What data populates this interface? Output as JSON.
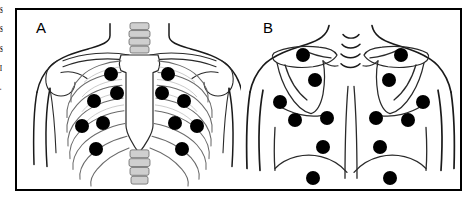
{
  "figure": {
    "caption_fragment_left": [
      "S",
      "S",
      "S",
      "I",
      "."
    ],
    "frame_color": "#000000",
    "background_color": "#ffffff",
    "marker_color": "#000000",
    "line_color": "#1a1a1a"
  },
  "panels": [
    {
      "id": "A",
      "label": "A",
      "view": "anterior-chest",
      "anatomy": [
        "neck",
        "shoulders",
        "clavicle-left",
        "clavicle-right",
        "sternum",
        "ribcage",
        "thoracic-spine",
        "scapula-left",
        "scapula-right"
      ],
      "marker_count": 12,
      "markers": [
        {
          "id": "A-R1",
          "side": "right",
          "cx": 94,
          "cy": 64,
          "r": 7.0
        },
        {
          "id": "A-R2",
          "side": "right",
          "cx": 100,
          "cy": 83,
          "r": 7.0
        },
        {
          "id": "A-R3",
          "side": "right",
          "cx": 77,
          "cy": 91,
          "r": 7.0
        },
        {
          "id": "A-R4",
          "side": "right",
          "cx": 86,
          "cy": 113,
          "r": 7.0
        },
        {
          "id": "A-R5",
          "side": "right",
          "cx": 65,
          "cy": 116,
          "r": 7.0
        },
        {
          "id": "A-R6",
          "side": "right",
          "cx": 79,
          "cy": 139,
          "r": 7.0
        },
        {
          "id": "A-L1",
          "side": "left",
          "cx": 151,
          "cy": 64,
          "r": 7.0
        },
        {
          "id": "A-L2",
          "side": "left",
          "cx": 145,
          "cy": 83,
          "r": 7.0
        },
        {
          "id": "A-L3",
          "side": "left",
          "cx": 167,
          "cy": 91,
          "r": 7.0
        },
        {
          "id": "A-L4",
          "side": "left",
          "cx": 158,
          "cy": 113,
          "r": 7.0
        },
        {
          "id": "A-L5",
          "side": "left",
          "cx": 180,
          "cy": 116,
          "r": 7.0
        },
        {
          "id": "A-L6",
          "side": "left",
          "cx": 165,
          "cy": 139,
          "r": 7.0
        }
      ]
    },
    {
      "id": "B",
      "label": "B",
      "view": "posterior-back",
      "anatomy": [
        "neck",
        "shoulders",
        "scapula-left",
        "scapula-right",
        "spinous-processes",
        "vertebral-line",
        "rib-margin"
      ],
      "marker_count": 12,
      "spinous_process_marks": 4,
      "markers": [
        {
          "id": "B-L1",
          "side": "left",
          "cx": 62,
          "cy": 45,
          "r": 7.0
        },
        {
          "id": "B-L2",
          "side": "left",
          "cx": 74,
          "cy": 70,
          "r": 7.0
        },
        {
          "id": "B-L3",
          "side": "left",
          "cx": 39,
          "cy": 92,
          "r": 7.0
        },
        {
          "id": "B-L4",
          "side": "left",
          "cx": 54,
          "cy": 110,
          "r": 7.0
        },
        {
          "id": "B-L5",
          "side": "left",
          "cx": 86,
          "cy": 108,
          "r": 7.0
        },
        {
          "id": "B-L6",
          "side": "left",
          "cx": 82,
          "cy": 137,
          "r": 7.0
        },
        {
          "id": "B-L7",
          "side": "left",
          "cx": 72,
          "cy": 168,
          "r": 7.0
        },
        {
          "id": "B-R1",
          "side": "right",
          "cx": 160,
          "cy": 45,
          "r": 7.0
        },
        {
          "id": "B-R2",
          "side": "right",
          "cx": 148,
          "cy": 70,
          "r": 7.0
        },
        {
          "id": "B-R3",
          "side": "right",
          "cx": 182,
          "cy": 92,
          "r": 7.0
        },
        {
          "id": "B-R4",
          "side": "right",
          "cx": 167,
          "cy": 110,
          "r": 7.0
        },
        {
          "id": "B-R5",
          "side": "right",
          "cx": 135,
          "cy": 108,
          "r": 7.0
        },
        {
          "id": "B-R6",
          "side": "right",
          "cx": 139,
          "cy": 137,
          "r": 7.0
        },
        {
          "id": "B-R7",
          "side": "right",
          "cx": 149,
          "cy": 168,
          "r": 7.0
        }
      ]
    }
  ]
}
